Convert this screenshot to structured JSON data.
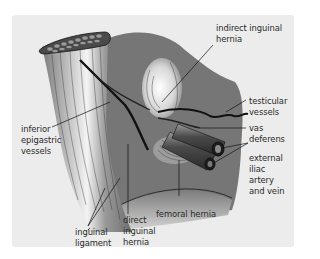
{
  "figure": {
    "panel_color": "#ececec",
    "tissue_dark": "#6a6a6a",
    "tissue_mid": "#8a8a8a",
    "labels": {
      "indirect_inguinal_hernia": [
        "indirect inguinal",
        "hernia"
      ],
      "testicular_vessels": [
        "testicular",
        "vessels"
      ],
      "vas_deferens": [
        "vas",
        "deferens"
      ],
      "external_iliac": [
        "external",
        "iliac",
        "artery",
        "and vein"
      ],
      "inferior_epigastric": [
        "inferior",
        "epigastric",
        "vessels"
      ],
      "femoral_hernia": [
        "femoral hernia"
      ],
      "direct_inguinal_hernia": [
        "direct",
        "inguinal",
        "hernia"
      ],
      "inguinal_ligament": [
        "inguinal",
        "ligament"
      ]
    }
  }
}
